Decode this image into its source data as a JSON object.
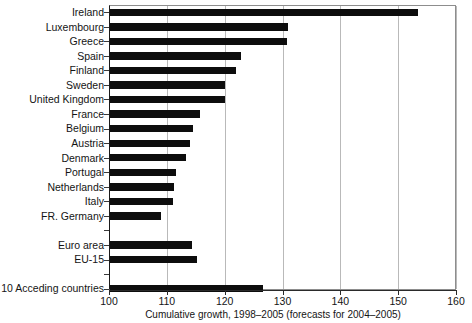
{
  "chart_data": {
    "type": "bar",
    "orientation": "horizontal",
    "title": "",
    "subtitle": "",
    "xlabel": "Cumulative growth, 1998–2005 (forecasts for 2004–2005)",
    "ylabel": "",
    "xlim": [
      100,
      160
    ],
    "ylim": [],
    "xticks": [
      100,
      110,
      120,
      130,
      140,
      150,
      160
    ],
    "xtick_labels": [
      "100",
      "110",
      "120",
      "130",
      "140",
      "150",
      "160"
    ],
    "grid": "vertical",
    "legend": "none",
    "bar_color": "#0d0d0d",
    "gridline_color": "#b9b9b9",
    "axis_color": "#111111",
    "categories": [
      "Ireland",
      "Luxembourg",
      "Greece",
      "Spain",
      "Finland",
      "Sweden",
      "United Kingdom",
      "France",
      "Belgium",
      "Austria",
      "Denmark",
      "Portugal",
      "Netherlands",
      "Italy",
      "FR. Germany",
      "",
      "Euro area",
      "EU-15",
      "",
      "10 Acceding countries"
    ],
    "values": [
      153.4,
      131.0,
      130.8,
      122.8,
      122.0,
      120.0,
      120.0,
      115.8,
      114.5,
      114.0,
      113.3,
      111.5,
      111.2,
      111.0,
      109.0,
      null,
      114.3,
      115.2,
      null,
      126.6
    ],
    "rows": [
      {
        "label": "Ireland",
        "value": 153.4,
        "spacer": false
      },
      {
        "label": "Luxembourg",
        "value": 131.0,
        "spacer": false
      },
      {
        "label": "Greece",
        "value": 130.8,
        "spacer": false
      },
      {
        "label": "Spain",
        "value": 122.8,
        "spacer": false
      },
      {
        "label": "Finland",
        "value": 122.0,
        "spacer": false
      },
      {
        "label": "Sweden",
        "value": 120.0,
        "spacer": false
      },
      {
        "label": "United Kingdom",
        "value": 120.0,
        "spacer": false
      },
      {
        "label": "France",
        "value": 115.8,
        "spacer": false
      },
      {
        "label": "Belgium",
        "value": 114.5,
        "spacer": false
      },
      {
        "label": "Austria",
        "value": 114.0,
        "spacer": false
      },
      {
        "label": "Denmark",
        "value": 113.3,
        "spacer": false
      },
      {
        "label": "Portugal",
        "value": 111.5,
        "spacer": false
      },
      {
        "label": "Netherlands",
        "value": 111.2,
        "spacer": false
      },
      {
        "label": "Italy",
        "value": 111.0,
        "spacer": false
      },
      {
        "label": "FR. Germany",
        "value": 109.0,
        "spacer": false
      },
      {
        "label": "",
        "value": null,
        "spacer": true
      },
      {
        "label": "Euro area",
        "value": 114.3,
        "spacer": false
      },
      {
        "label": "EU-15",
        "value": 115.2,
        "spacer": false
      },
      {
        "label": "",
        "value": null,
        "spacer": true
      },
      {
        "label": "10 Acceding countries",
        "value": 126.6,
        "spacer": false
      }
    ]
  }
}
